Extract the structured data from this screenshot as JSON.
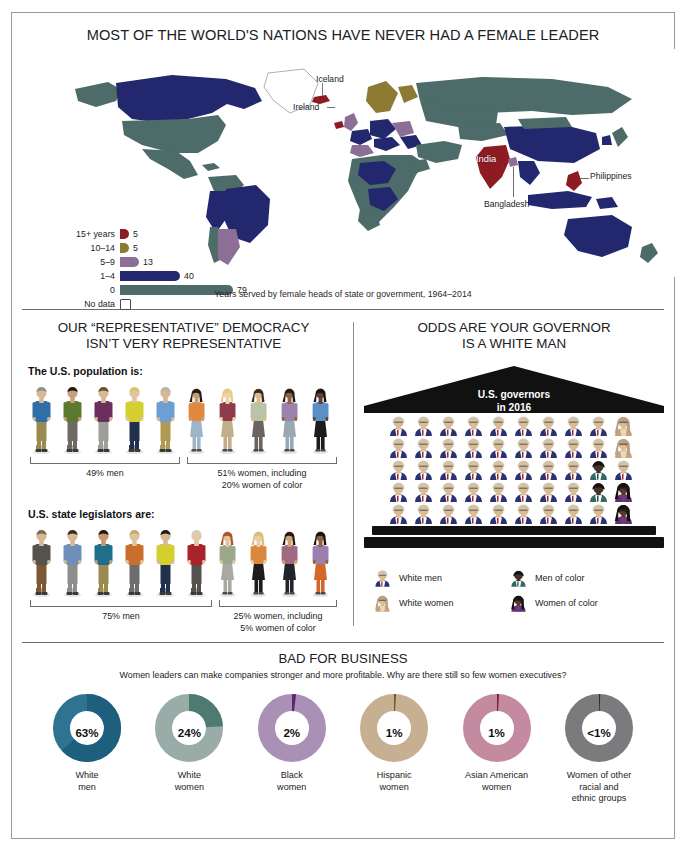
{
  "map_panel": {
    "title": "MOST OF THE WORLD'S NATIONS HAVE NEVER HAD A FEMALE LEADER",
    "caption": "Years served by female heads of state or government, 1964–2014",
    "country_labels": [
      {
        "name": "Iceland",
        "style": "dark"
      },
      {
        "name": "Ireland",
        "style": "dark"
      },
      {
        "name": "India",
        "style": "light"
      },
      {
        "name": "Bangladesh",
        "style": "dark"
      },
      {
        "name": "Philippines",
        "style": "dark"
      }
    ],
    "legend": [
      {
        "label": "15+ years",
        "value": "5",
        "count": 5,
        "color": "#8e1b22"
      },
      {
        "label": "10–14",
        "value": "5",
        "count": 5,
        "color": "#8d7b33"
      },
      {
        "label": "5–9",
        "value": "13",
        "count": 13,
        "color": "#8b6f96"
      },
      {
        "label": "1–4",
        "value": "40",
        "count": 40,
        "color": "#22276e"
      },
      {
        "label": "0",
        "value": "79",
        "count": 79,
        "color": "#4d6b68"
      },
      {
        "label": "No data",
        "value": "",
        "count": 0,
        "color": "#ffffff"
      }
    ]
  },
  "democracy_panel": {
    "title_line1": "OUR “REPRESENTATIVE” DEMOCRACY",
    "title_line2": "ISN’T VERY REPRESENTATIVE",
    "groups": [
      {
        "heading": "The U.S. population is:",
        "men_count": 5,
        "women_count": 5,
        "men_caption": "49% men",
        "women_caption_line1": "51% women, including",
        "women_caption_line2": "20% women of color"
      },
      {
        "heading": "U.S. state legislators are:",
        "men_count": 6,
        "women_count": 4,
        "men_caption": "75% men",
        "women_caption_line1": "25% women, including",
        "women_caption_line2": "5% women of color"
      }
    ]
  },
  "governors_panel": {
    "title_line1": "ODDS ARE YOUR GOVERNOR",
    "title_line2": "IS A WHITE MAN",
    "pediment_line1": "U.S. governors",
    "pediment_line2": "in 2016",
    "grid_columns": 10,
    "grid_rows": 5,
    "total": 50,
    "counts": {
      "white_men": 44,
      "men_of_color": 2,
      "white_women": 2,
      "women_of_color": 2
    },
    "legend": [
      {
        "key": "white_men",
        "label": "White men"
      },
      {
        "key": "men_of_color",
        "label": "Men of color"
      },
      {
        "key": "white_women",
        "label": "White women"
      },
      {
        "key": "women_of_color",
        "label": "Women of color"
      }
    ]
  },
  "business_panel": {
    "title": "BAD FOR BUSINESS",
    "subtitle": "Women leaders can make companies stronger and more profitable. Why are there still so few women executives?"
  },
  "chart_data": [
    {
      "type": "bar",
      "title": "Years served by female heads of state or government, 1964–2014",
      "orientation": "horizontal",
      "categories": [
        "15+ years",
        "10–14",
        "5–9",
        "1–4",
        "0",
        "No data"
      ],
      "values": [
        5,
        5,
        13,
        40,
        79,
        null
      ],
      "value_labels": [
        "5",
        "5",
        "13",
        "40",
        "79",
        ""
      ],
      "colors": [
        "#8e1b22",
        "#8d7b33",
        "#8b6f96",
        "#22276e",
        "#4d6b68",
        "#ffffff"
      ],
      "xlabel": "Number of nations",
      "ylabel": "",
      "xlim": [
        0,
        79
      ],
      "grid": false,
      "legend": "left"
    },
    {
      "type": "pictogram",
      "title": "The U.S. population is:",
      "categories": [
        "men",
        "women"
      ],
      "values": [
        49,
        51
      ],
      "unit": "percent",
      "icons": [
        5,
        5
      ],
      "annotations": [
        "49% men",
        "51% women, including 20% women of color"
      ]
    },
    {
      "type": "pictogram",
      "title": "U.S. state legislators are:",
      "categories": [
        "men",
        "women"
      ],
      "values": [
        75,
        25
      ],
      "unit": "percent",
      "icons": [
        6,
        4
      ],
      "annotations": [
        "75% men",
        "25% women, including 5% women of color"
      ]
    },
    {
      "type": "pictogram",
      "title": "U.S. governors in 2016",
      "categories": [
        "White men",
        "Men of color",
        "White women",
        "Women of color"
      ],
      "values": [
        44,
        2,
        2,
        2
      ],
      "unit": "governors",
      "total": 50,
      "grid": "10 x 5"
    },
    {
      "type": "pie",
      "title": "BAD FOR BUSINESS",
      "subtitle": "Share of executive positions",
      "labels": [
        "White men",
        "White women",
        "Black women",
        "Hispanic women",
        "Asian American women",
        "Women of other racial and ethnic groups"
      ],
      "values": [
        63,
        24,
        2,
        1,
        1,
        0.5
      ],
      "value_labels": [
        "63%",
        "24%",
        "2%",
        "1%",
        "1%",
        "<1%"
      ],
      "colors": [
        "#2f7393",
        "#8fa29e",
        "#a78bb0",
        "#c3ab8c",
        "#c2889c",
        "#77777a"
      ],
      "donut": true
    }
  ],
  "donuts": [
    {
      "pct_label": "63%",
      "pct": 63,
      "label_line1": "White",
      "label_line2": "men",
      "label_line3": "",
      "color": "#2f7393",
      "dark": "#1f5f7e"
    },
    {
      "pct_label": "24%",
      "pct": 24,
      "label_line1": "White",
      "label_line2": "women",
      "label_line3": "",
      "color": "#9aaca8",
      "dark": "#4e7a72"
    },
    {
      "pct_label": "2%",
      "pct": 2,
      "label_line1": "Black",
      "label_line2": "women",
      "label_line3": "",
      "color": "#ab90b6",
      "dark": "#5e2a6e"
    },
    {
      "pct_label": "1%",
      "pct": 1,
      "label_line1": "Hispanic",
      "label_line2": "women",
      "label_line3": "",
      "color": "#c7b091",
      "dark": "#6b5a28"
    },
    {
      "pct_label": "1%",
      "pct": 1,
      "label_line1": "Asian American",
      "label_line2": "women",
      "label_line3": "",
      "color": "#c48ba0",
      "dark": "#7a1f3c"
    },
    {
      "pct_label": "<1%",
      "pct": 0.6,
      "label_line1": "Women of other",
      "label_line2": "racial and",
      "label_line3": "ethnic groups",
      "color": "#7b7b7e",
      "dark": "#2b2b2e"
    }
  ],
  "people": {
    "population_men": [
      {
        "skin": "#d8b894",
        "hair": "#8f8f86",
        "top": "#2f6fa8",
        "bottom": "#9c8b50"
      },
      {
        "skin": "#caa078",
        "hair": "#201a15",
        "top": "#5a7a2e",
        "bottom": "#6d6a63"
      },
      {
        "skin": "#d8b894",
        "hair": "#6b4f31",
        "top": "#6b2f5e",
        "bottom": "#9d9d9a"
      },
      {
        "skin": "#e3c49c",
        "hair": "#d9c06a",
        "top": "#d4cf2e",
        "bottom": "#22304d"
      },
      {
        "skin": "#d8b894",
        "hair": "#b9b4ab",
        "top": "#6d9fd2",
        "bottom": "#b09a55"
      }
    ],
    "population_women": [
      {
        "skin": "#c89a70",
        "hair": "#241a14",
        "top": "#e08840",
        "bottom": "#9fb4c6"
      },
      {
        "skin": "#ecd2ae",
        "hair": "#e6cd7e",
        "top": "#8e3b4e",
        "bottom": "#c2ae8a"
      },
      {
        "skin": "#ddb990",
        "hair": "#3a2b20",
        "top": "#b9c3a6",
        "bottom": "#6b6560"
      },
      {
        "skin": "#8e6243",
        "hair": "#241a14",
        "top": "#9b83ab",
        "bottom": "#9aa8b4"
      },
      {
        "skin": "#5c4030",
        "hair": "#181311",
        "top": "#5b8fc6",
        "bottom": "#1c1c1c"
      }
    ],
    "legislator_men": [
      {
        "skin": "#d8b894",
        "hair": "#7a6a52",
        "top": "#55524e",
        "bottom": "#7b5733"
      },
      {
        "skin": "#d8b894",
        "hair": "#3a2b20",
        "top": "#6d8fb8",
        "bottom": "#8e8e8c"
      },
      {
        "skin": "#c79a6c",
        "hair": "#241a14",
        "top": "#1f6e8c",
        "bottom": "#9c8b50"
      },
      {
        "skin": "#e0c49e",
        "hair": "#c8a96a",
        "top": "#c96f2e",
        "bottom": "#6d6d6c"
      },
      {
        "skin": "#d8b894",
        "hair": "#241a14",
        "top": "#d4cf2e",
        "bottom": "#22304d"
      },
      {
        "skin": "#e3c9a8",
        "hair": "#cfcfc8",
        "top": "#a8242a",
        "bottom": "#55524e"
      }
    ],
    "legislator_women": [
      {
        "skin": "#e3c49c",
        "hair": "#a8552e",
        "top": "#9aa88c",
        "bottom": "#a9a9a4"
      },
      {
        "skin": "#e8cfa8",
        "hair": "#d8be78",
        "top": "#d98840",
        "bottom": "#1c1c1c"
      },
      {
        "skin": "#d2a277",
        "hair": "#241a14",
        "top": "#a16a82",
        "bottom": "#22242a"
      },
      {
        "skin": "#8e6243",
        "hair": "#1a1410",
        "top": "#9b7fae",
        "bottom": "#d4682a"
      }
    ]
  }
}
